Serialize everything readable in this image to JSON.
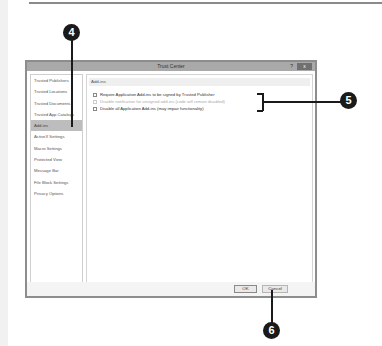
{
  "dialog": {
    "title": "Trust Center",
    "help_label": "?",
    "close_label": "x"
  },
  "sidebar": {
    "items": [
      {
        "label": "Trusted Publishers",
        "active": false
      },
      {
        "label": "Trusted Locations",
        "active": false
      },
      {
        "label": "Trusted Documents",
        "active": false
      },
      {
        "label": "Trusted App Catalogs",
        "active": false
      },
      {
        "label": "Add-ins",
        "active": true
      },
      {
        "label": "ActiveX Settings",
        "active": false
      },
      {
        "label": "Macro Settings",
        "active": false
      },
      {
        "label": "Protected View",
        "active": false
      },
      {
        "label": "Message Bar",
        "active": false
      },
      {
        "label": "File Block Settings",
        "active": false
      },
      {
        "label": "Privacy Options",
        "active": false
      }
    ]
  },
  "content": {
    "section_header": "Add-ins",
    "options": [
      {
        "label": "Require Application Add-ins to be signed by Trusted Publisher",
        "checked": false,
        "disabled": false
      },
      {
        "label": "Disable notification for unsigned add-ins (code will remain disabled)",
        "checked": false,
        "disabled": true
      },
      {
        "label": "Disable all Application Add-ins (may impair functionality)",
        "checked": false,
        "disabled": false
      }
    ]
  },
  "footer": {
    "ok_label": "OK",
    "cancel_label": "Cancel"
  },
  "callouts": {
    "c4": "4",
    "c5": "5",
    "c6": "6"
  }
}
